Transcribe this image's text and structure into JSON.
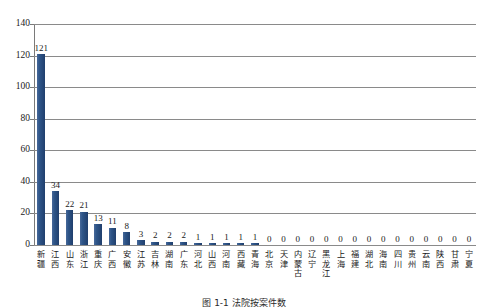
{
  "chart_data": {
    "type": "bar",
    "title": "",
    "xlabel": "",
    "ylabel": "",
    "ylim": [
      0,
      140
    ],
    "ytick_step": 20,
    "yticks": [
      0,
      20,
      40,
      60,
      80,
      100,
      120,
      140
    ],
    "grid": true,
    "legend": "none",
    "bar_color": "#2e5588",
    "categories": [
      "新疆",
      "江西",
      "山东",
      "浙江",
      "重庆",
      "广西",
      "安徽",
      "江苏",
      "吉林",
      "湖南",
      "广东",
      "河北",
      "山西",
      "河南",
      "西藏",
      "青海",
      "北京",
      "天津",
      "内蒙古",
      "辽宁",
      "黑龙江",
      "上海",
      "福建",
      "湖北",
      "海南",
      "四川",
      "贵州",
      "云南",
      "陕西",
      "甘肃",
      "宁夏"
    ],
    "values": [
      121,
      34,
      22,
      21,
      13,
      11,
      8,
      3,
      2,
      2,
      2,
      1,
      1,
      1,
      1,
      1,
      0,
      0,
      0,
      0,
      0,
      0,
      0,
      0,
      0,
      0,
      0,
      0,
      0,
      0,
      0
    ]
  },
  "caption": "图 1-1  法院按案件数",
  "axis": {
    "y_max_label": "140",
    "y_min_label": "0"
  }
}
